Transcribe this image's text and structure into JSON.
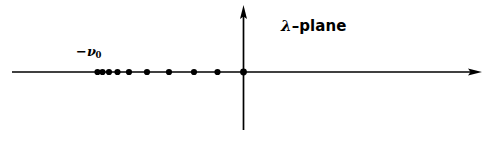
{
  "figure": {
    "background_color": "#ffffff",
    "ink_color": "#000000",
    "width": 498,
    "height": 143
  },
  "labels": {
    "plane": {
      "symbol": "λ",
      "dash": "–",
      "word": "plane",
      "full_text": "λ–plane",
      "x": 281,
      "y": 19
    },
    "accumulation_point": {
      "minus": "−",
      "symbol": "ν",
      "subscript": "0",
      "full_text": "−ν₀",
      "x": 76,
      "y": 45
    }
  },
  "axes": {
    "real": {
      "name": "real-axis",
      "x1": 12,
      "x2": 482,
      "y": 72,
      "arrow_end": "right",
      "stroke_width": 1.6
    },
    "imaginary": {
      "name": "imaginary-axis",
      "x": 243.5,
      "y1": 5,
      "y2": 130,
      "arrow_end": "top",
      "stroke_width": 1.6
    },
    "origin": {
      "x": 243.5,
      "y": 72
    }
  },
  "chart_data": {
    "type": "scatter",
    "title": "λ–plane",
    "xlabel": "",
    "ylabel": "",
    "grid": false,
    "legend": null,
    "axis_style": "arrowed-cross",
    "annotations": [
      {
        "text": "−ν₀",
        "x_px": 76,
        "y_px": 45,
        "describes": "accumulation point of the eigenvalue sequence on the negative real axis"
      },
      {
        "text": "λ–plane",
        "x_px": 281,
        "y_px": 19,
        "describes": "name of the complex plane depicted"
      }
    ],
    "series": [
      {
        "name": "eigenvalues",
        "marker": "filled-circle",
        "marker_radius_px": 3.1,
        "color": "#000000",
        "points_px": [
          {
            "x": 97.5,
            "y": 72
          },
          {
            "x": 102.5,
            "y": 72
          },
          {
            "x": 109.0,
            "y": 72
          },
          {
            "x": 117.5,
            "y": 72
          },
          {
            "x": 129.0,
            "y": 72
          },
          {
            "x": 147.0,
            "y": 72
          },
          {
            "x": 169.0,
            "y": 72
          },
          {
            "x": 194.0,
            "y": 72
          },
          {
            "x": 217.5,
            "y": 72
          }
        ]
      },
      {
        "name": "origin-point",
        "marker": "filled-circle",
        "marker_radius_px": 3.4,
        "color": "#000000",
        "points_px": [
          {
            "x": 243.5,
            "y": 72
          }
        ]
      }
    ]
  }
}
